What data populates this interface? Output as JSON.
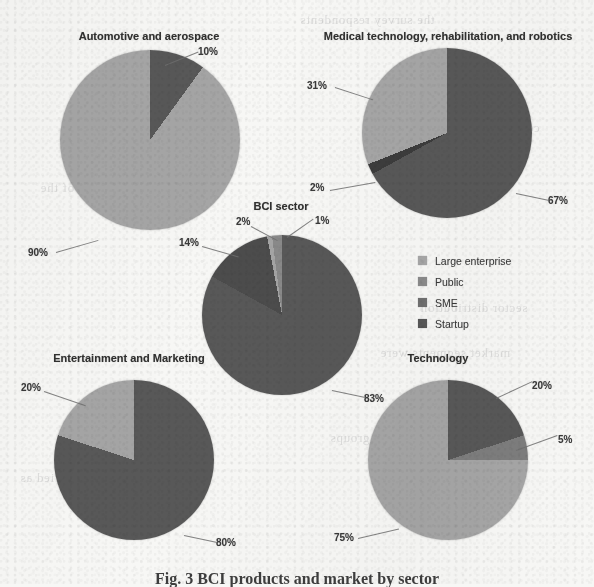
{
  "figure": {
    "caption": "Fig. 3  BCI products and market by sector",
    "background_color": "#f7f7f5"
  },
  "legend": {
    "position": "center-right",
    "entries": [
      {
        "label": "Large enterprise",
        "color": "#a6a6a6"
      },
      {
        "label": "Public",
        "color": "#8a8a8a"
      },
      {
        "label": "SME",
        "color": "#6f6f6f"
      },
      {
        "label": "Startup",
        "color": "#575757"
      }
    ]
  },
  "bleed_text": [
    {
      "text": "the survey respondents",
      "x": 300,
      "y": 12
    },
    {
      "text": "commercial landscape",
      "x": 410,
      "y": 120
    },
    {
      "text": "of the interviewed",
      "x": 395,
      "y": 170
    },
    {
      "text": "sector distribution",
      "x": 420,
      "y": 300
    },
    {
      "text": "market segments were",
      "x": 380,
      "y": 345
    },
    {
      "text": "and research groups",
      "x": 330,
      "y": 430
    },
    {
      "text": "were identified as",
      "x": 20,
      "y": 470
    },
    {
      "text": "analysis of the",
      "x": 40,
      "y": 180
    }
  ],
  "chart_data": [
    {
      "type": "pie",
      "title": "Automotive and aerospace",
      "categories": [
        "Large enterprise",
        "Startup"
      ],
      "values": [
        90,
        10
      ],
      "colors": [
        "#a6a6a6",
        "#575757"
      ],
      "labels": [
        "90%",
        "10%"
      ]
    },
    {
      "type": "pie",
      "title": "Medical technology, rehabilitation, and robotics",
      "categories": [
        "Large enterprise",
        "Public",
        "Startup"
      ],
      "values": [
        31,
        2,
        67
      ],
      "colors": [
        "#a6a6a6",
        "#3a3a3a",
        "#575757"
      ],
      "labels": [
        "31%",
        "2%",
        "67%"
      ]
    },
    {
      "type": "pie",
      "title": "BCI sector",
      "categories": [
        "Large enterprise",
        "Public",
        "SME",
        "Startup"
      ],
      "values": [
        1,
        2,
        14,
        83
      ],
      "colors": [
        "#a6a6a6",
        "#8a8a8a",
        "#4a4a4a",
        "#575757"
      ],
      "labels": [
        "1%",
        "2%",
        "14%",
        "83%"
      ]
    },
    {
      "type": "pie",
      "title": "Entertainment and Marketing",
      "categories": [
        "Large enterprise",
        "Startup"
      ],
      "values": [
        20,
        80
      ],
      "colors": [
        "#a6a6a6",
        "#575757"
      ],
      "labels": [
        "20%",
        "80%"
      ]
    },
    {
      "type": "pie",
      "title": "Technology",
      "categories": [
        "Large enterprise",
        "SME",
        "Startup"
      ],
      "values": [
        75,
        5,
        20
      ],
      "colors": [
        "#a6a6a6",
        "#7d7d7d",
        "#575757"
      ],
      "labels": [
        "75%",
        "5%",
        "20%"
      ]
    }
  ]
}
